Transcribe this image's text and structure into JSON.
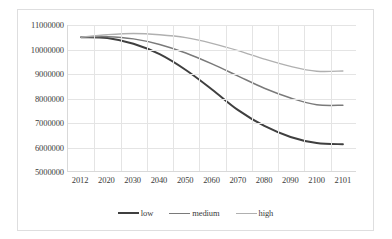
{
  "chart_data": {
    "type": "line",
    "title": "",
    "subtitle": "",
    "xlabel": "",
    "ylabel": "",
    "grid": true,
    "legend_position": "bottom",
    "categories": [
      "2012",
      "2020",
      "2030",
      "2040",
      "2050",
      "2060",
      "2070",
      "2080",
      "2090",
      "2100",
      "2101"
    ],
    "ylim": [
      5000000,
      11000000
    ],
    "yticks": [
      "5000000",
      "6000000",
      "7000000",
      "8000000",
      "9000000",
      "10000000",
      "11000000"
    ],
    "ytick_values": [
      5000000,
      6000000,
      7000000,
      8000000,
      9000000,
      10000000,
      11000000
    ],
    "series": [
      {
        "name": "low",
        "color": "#3f3f3f",
        "values": [
          10500000,
          10470000,
          10230000,
          9800000,
          9150000,
          8350000,
          7500000,
          6850000,
          6400000,
          6150000,
          6100000
        ]
      },
      {
        "name": "medium",
        "color": "#7a7a7a",
        "values": [
          10500000,
          10520000,
          10430000,
          10200000,
          9850000,
          9400000,
          8900000,
          8400000,
          8000000,
          7720000,
          7700000
        ]
      },
      {
        "name": "high",
        "color": "#b0b0b0",
        "values": [
          10500000,
          10600000,
          10650000,
          10600000,
          10480000,
          10250000,
          9950000,
          9600000,
          9300000,
          9100000,
          9110000
        ]
      }
    ]
  },
  "legend": {
    "items": [
      {
        "label": "low"
      },
      {
        "label": "medium"
      },
      {
        "label": "high"
      }
    ]
  },
  "colors": {
    "low": "#3f3f3f",
    "medium": "#7a7a7a",
    "high": "#b0b0b0",
    "grid": "#e4e4e4",
    "axis": "#d9d9d9",
    "frame": "#dededf",
    "text": "#3b3b3b"
  }
}
